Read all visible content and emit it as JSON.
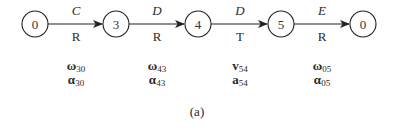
{
  "nodes": [
    {
      "id": "n1",
      "label": "0",
      "cx": 35
    },
    {
      "id": "n2",
      "label": "3",
      "cx": 116
    },
    {
      "id": "n3",
      "label": "4",
      "cx": 198
    },
    {
      "id": "n4",
      "label": "5",
      "cx": 281
    },
    {
      "id": "n5",
      "label": "0",
      "cx": 363
    }
  ],
  "edges": [
    {
      "from": "0",
      "to": "3",
      "top": "C",
      "type": "R",
      "vec1": "ω",
      "vec1_sub": "30",
      "vec2": "α",
      "vec2_sub": "30",
      "cx": 76
    },
    {
      "from": "3",
      "to": "4",
      "top": "D",
      "type": "R",
      "vec1": "ω",
      "vec1_sub": "43",
      "vec2": "α",
      "vec2_sub": "43",
      "cx": 157
    },
    {
      "from": "4",
      "to": "5",
      "top": "D",
      "type": "T",
      "vec1": "v",
      "vec1_sub": "54",
      "vec2": "a",
      "vec2_sub": "54",
      "cx": 240
    },
    {
      "from": "5",
      "to": "0",
      "top": "E",
      "type": "R",
      "vec1": "ω",
      "vec1_sub": "05",
      "vec2": "α",
      "vec2_sub": "05",
      "cx": 322
    }
  ],
  "caption": "(a)"
}
